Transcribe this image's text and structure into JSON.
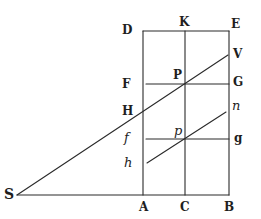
{
  "figure": {
    "type": "geometric-diagram",
    "labels": {
      "D": "D",
      "K": "K",
      "E": "E",
      "V": "V",
      "F": "F",
      "P": "P",
      "G": "G",
      "H": "H",
      "n": "n",
      "f": "f",
      "p": "p",
      "g": "g",
      "h": "h",
      "S": "S",
      "A": "A",
      "C": "C",
      "B": "B"
    },
    "points": {
      "D": [
        143,
        31
      ],
      "K": [
        185,
        31
      ],
      "E": [
        229,
        31
      ],
      "V": [
        228,
        55
      ],
      "F": [
        143,
        84
      ],
      "P": [
        185,
        84
      ],
      "G": [
        229,
        84
      ],
      "H": [
        143,
        113
      ],
      "n": [
        226,
        112
      ],
      "f": [
        143,
        139
      ],
      "p": [
        185,
        139
      ],
      "g": [
        229,
        139
      ],
      "h": [
        147,
        163
      ],
      "S": [
        17,
        195
      ],
      "A": [
        143,
        195
      ],
      "C": [
        185,
        195
      ],
      "B": [
        229,
        195
      ]
    },
    "segments": [
      [
        "D",
        "E"
      ],
      [
        "D",
        "A"
      ],
      [
        "E",
        "B"
      ],
      [
        "S",
        "B"
      ],
      [
        "K",
        "C"
      ],
      [
        "F",
        "G"
      ],
      [
        "f",
        "g"
      ],
      [
        "S",
        "V"
      ],
      [
        "h",
        "n"
      ]
    ],
    "stroke_color": "#2a2a2a",
    "background": "#ffffff"
  }
}
